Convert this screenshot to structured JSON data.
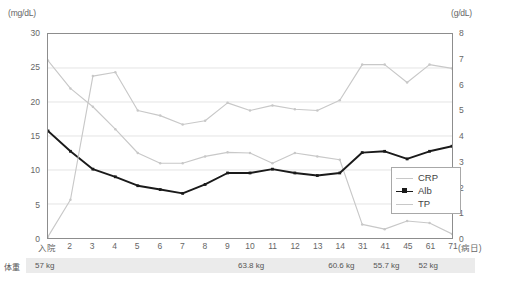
{
  "axes": {
    "left_unit": "(mg/dL)",
    "right_unit": "(g/dL)",
    "left_ticks": [
      "30",
      "25",
      "20",
      "15",
      "10",
      "5",
      "0"
    ],
    "right_ticks": [
      "8",
      "7",
      "6",
      "5",
      "4",
      "3",
      "2",
      "1",
      "0"
    ],
    "x_axis_suffix": "(病日)"
  },
  "legend": {
    "items": [
      {
        "label": "CRP",
        "color": "#c8c8c8",
        "marker": "none"
      },
      {
        "label": "Alb",
        "color": "#1a1a1a",
        "marker": "square"
      },
      {
        "label": "TP",
        "color": "#c8c8c8",
        "marker": "none"
      }
    ]
  },
  "weight": {
    "title": "体重",
    "entries": [
      {
        "index": 0,
        "value": "57 kg"
      },
      {
        "index": 9,
        "value": "63.8 kg"
      },
      {
        "index": 13,
        "value": "60.6 kg"
      },
      {
        "index": 15,
        "value": "55.7 kg"
      },
      {
        "index": 17,
        "value": "52 kg"
      }
    ]
  },
  "chart_data": {
    "type": "line",
    "title": "",
    "xlabel": "(病日)",
    "ylabel": "(mg/dL)",
    "y2label": "(g/dL)",
    "ylim": [
      0,
      30
    ],
    "y2lim": [
      0,
      8
    ],
    "grid": true,
    "legend_position": "bottom-right",
    "categories": [
      "入院",
      "2",
      "3",
      "4",
      "5",
      "6",
      "7",
      "8",
      "9",
      "10",
      "11",
      "12",
      "13",
      "14",
      "31",
      "41",
      "45",
      "61",
      "71"
    ],
    "series": [
      {
        "name": "CRP",
        "axis": "left",
        "unit": "mg/dL",
        "color": "#c8c8c8",
        "values": [
          26.1,
          22.0,
          19.3,
          16.0,
          12.5,
          11.0,
          11.0,
          12.0,
          12.6,
          12.5,
          11.0,
          12.5,
          12.0,
          11.5,
          2.0,
          1.3,
          2.5,
          2.2,
          0.6
        ]
      },
      {
        "name": "Alb",
        "axis": "right",
        "unit": "g/dL",
        "color": "#1a1a1a",
        "values": [
          4.2,
          3.4,
          2.7,
          2.4,
          2.05,
          1.9,
          1.75,
          2.1,
          2.55,
          2.55,
          2.7,
          2.55,
          2.45,
          2.55,
          3.35,
          3.4,
          3.1,
          3.4,
          3.6
        ]
      },
      {
        "name": "TP",
        "axis": "right",
        "unit": "g/dL",
        "color": "#c8c8c8",
        "values": [
          0.05,
          1.5,
          6.35,
          6.5,
          5.0,
          4.8,
          4.45,
          4.6,
          5.3,
          5.0,
          5.2,
          5.05,
          5.0,
          5.4,
          6.8,
          6.8,
          6.1,
          6.8,
          6.65
        ]
      }
    ]
  }
}
